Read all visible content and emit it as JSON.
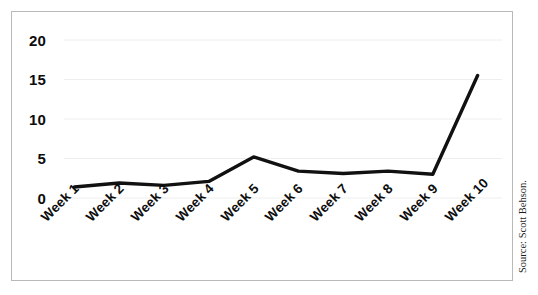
{
  "chart_data": {
    "type": "line",
    "title": "",
    "subtitle": "",
    "xlabel": "",
    "ylabel": "",
    "categories": [
      "Week 1",
      "Week 2",
      "Week 3",
      "Week 4",
      "Week 5",
      "Week 6",
      "Week 7",
      "Week 8",
      "Week 9",
      "Week 10"
    ],
    "values": [
      1.4,
      1.9,
      1.6,
      2.1,
      5.2,
      3.4,
      3.1,
      3.4,
      3.0,
      15.5
    ],
    "series": [
      {
        "name": "",
        "values": [
          1.4,
          1.9,
          1.6,
          2.1,
          5.2,
          3.4,
          3.1,
          3.4,
          3.0,
          15.5
        ]
      }
    ],
    "ylim": [
      0,
      21
    ],
    "yticks": [
      0,
      5,
      10,
      15,
      20
    ],
    "ytick_labels": [
      "0",
      "5",
      "10",
      "15",
      "20"
    ],
    "grid": true,
    "grid_axis": "y",
    "legend": false,
    "legend_position": "none",
    "line_color": "#111111",
    "line_width": 3.4,
    "background_color": "#ffffff",
    "frame_color": "#b9b9b9",
    "gridline_color": "#eeeeee",
    "tick_label_color": "#0d0d0d",
    "xtick_rotation": -45,
    "annotations": []
  },
  "credit": {
    "source_text": "Source: Scott Behson."
  }
}
